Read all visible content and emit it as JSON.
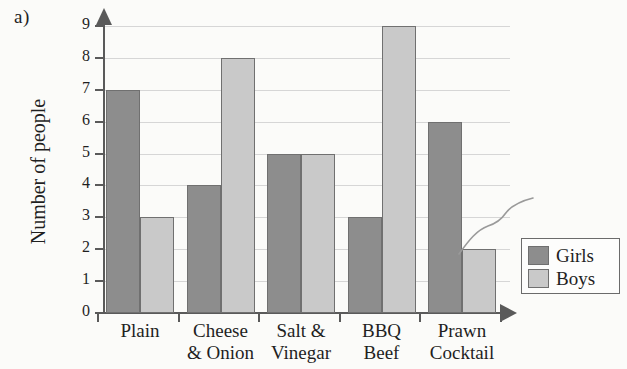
{
  "part_label": "a)",
  "chart_data": {
    "type": "bar",
    "title": "",
    "xlabel": "",
    "ylabel": "Number of people",
    "ylim": [
      0,
      9
    ],
    "y_ticks": [
      0,
      1,
      2,
      3,
      4,
      5,
      6,
      7,
      8,
      9
    ],
    "grid": true,
    "legend_position": "right",
    "categories": [
      "Plain",
      "Cheese\n& Onion",
      "Salt &\nVinegar",
      "BBQ\nBeef",
      "Prawn\nCocktail"
    ],
    "series": [
      {
        "name": "Girls",
        "color": "#8d8d8d",
        "values": [
          7,
          4,
          5,
          3,
          6
        ]
      },
      {
        "name": "Boys",
        "color": "#c9c9c9",
        "values": [
          3,
          8,
          5,
          9,
          2
        ]
      }
    ]
  },
  "legend": {
    "items": [
      {
        "label": "Girls",
        "color": "#8d8d8d"
      },
      {
        "label": "Boys",
        "color": "#c9c9c9"
      }
    ]
  },
  "colors": {
    "girls": "#8d8d8d",
    "boys": "#c9c9c9",
    "axis": "#5a5a5a",
    "grid": "#d6d6d6",
    "background": "#fbfbf9"
  }
}
